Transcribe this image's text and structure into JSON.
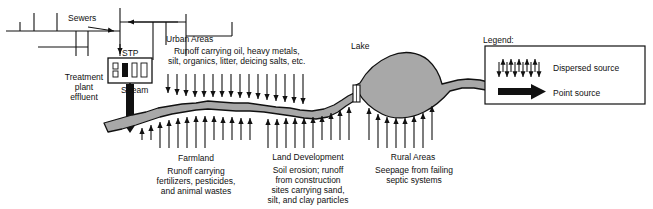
{
  "diagram": {
    "colors": {
      "water_fill": "#a8a8a8",
      "outline": "#111111",
      "background": "#ffffff",
      "arrow": "#111111"
    },
    "labels": {
      "sewers": "Sewers",
      "stp": "STP",
      "urban_areas": "Urban Areas",
      "urban_runoff": "Runoff carrying oil, heavy metals,\nsilt, organics, litter, deicing salts, etc.",
      "treatment_plant_effluent": "Treatment\nplant\neffluent",
      "stream": "Stream",
      "lake": "Lake",
      "farmland": "Farmland",
      "farmland_desc": "Runoff carrying\nfertilizers, pesticides,\nand animal wastes",
      "land_development": "Land Development",
      "land_development_desc": "Soil erosion; runoff\nfrom construction\nsites carrying sand,\nsilt, and clay particles",
      "rural_areas": "Rural Areas",
      "rural_areas_desc": "Seepage from failing\nseptic systems"
    },
    "legend": {
      "title": "Legend:",
      "items": [
        {
          "label": "Dispersed source",
          "icon": "dispersed-arrows-icon"
        },
        {
          "label": "Point source",
          "icon": "thick-arrow-icon"
        }
      ]
    },
    "icons": {
      "stp_plant": "treatment-plant-icon",
      "point_source_arrow": "point-source-arrow-icon",
      "dispersed_source_arrows": "dispersed-source-arrows-icon",
      "dam": "dam-icon"
    }
  }
}
